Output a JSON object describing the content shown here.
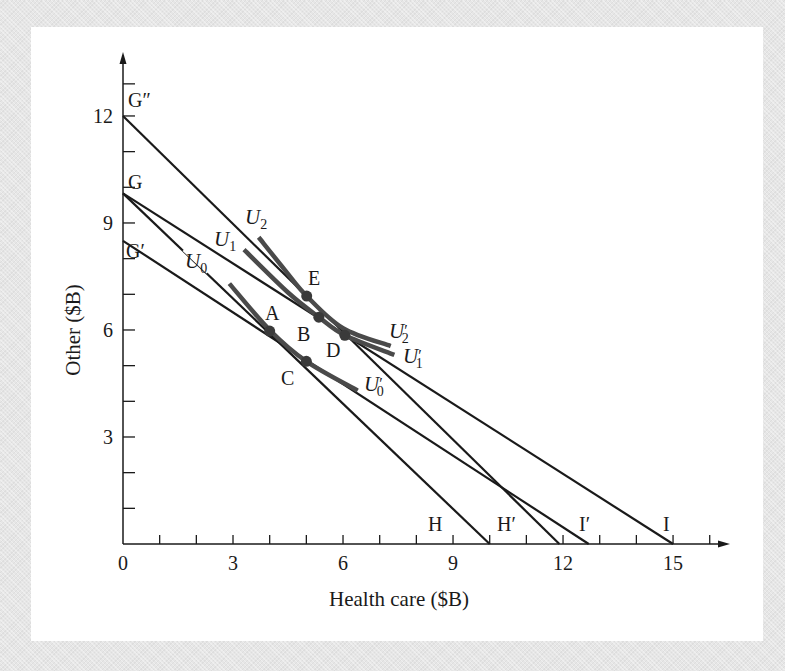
{
  "chart_data": {
    "type": "line",
    "title": "",
    "xlabel": "Health care ($B)",
    "ylabel": "Other ($B)",
    "xlim": [
      0,
      16
    ],
    "ylim": [
      0,
      13
    ],
    "xticks": [
      0,
      3,
      6,
      9,
      12,
      15
    ],
    "yticks": [
      3,
      6,
      9,
      12
    ],
    "origin_label": "0",
    "grid": false,
    "budget_lines": [
      {
        "name": "G-H",
        "start_label": "G",
        "end_label": "H",
        "points": [
          [
            0,
            9.83
          ],
          [
            10.0,
            0
          ]
        ]
      },
      {
        "name": "G'-I'",
        "start_label": "G'",
        "end_label": "I'",
        "points": [
          [
            0,
            8.5
          ],
          [
            12.7,
            0
          ]
        ]
      },
      {
        "name": "G-I",
        "start_label": "G",
        "end_label": "I",
        "points": [
          [
            0,
            9.83
          ],
          [
            15.0,
            0
          ]
        ]
      },
      {
        "name": "G''-H'",
        "start_label": "G''",
        "end_label": "H'",
        "points": [
          [
            0,
            12.0
          ],
          [
            11.9,
            0
          ]
        ]
      }
    ],
    "indifference_curves": [
      {
        "name": "U0",
        "label_start": "U0",
        "label_end": "U'0",
        "points": [
          [
            2.9,
            7.3
          ],
          [
            4.0,
            6.0
          ],
          [
            5.0,
            5.12
          ],
          [
            6.4,
            4.3
          ]
        ]
      },
      {
        "name": "U1",
        "label_start": "U1",
        "label_end": "U'1",
        "points": [
          [
            3.3,
            8.25
          ],
          [
            4.5,
            7.05
          ],
          [
            5.34,
            6.36
          ],
          [
            6.05,
            5.85
          ],
          [
            7.4,
            5.3
          ]
        ]
      },
      {
        "name": "U2",
        "label_start": "U2",
        "label_end": "U'2",
        "points": [
          [
            3.7,
            8.6
          ],
          [
            4.4,
            7.7
          ],
          [
            5.01,
            6.95
          ],
          [
            6.0,
            6.05
          ],
          [
            7.3,
            5.55
          ]
        ]
      }
    ],
    "points": [
      {
        "label": "A",
        "x": 4.0,
        "y": 5.97
      },
      {
        "label": "B",
        "x": 5.34,
        "y": 6.36
      },
      {
        "label": "C",
        "x": 5.0,
        "y": 5.12
      },
      {
        "label": "D",
        "x": 6.05,
        "y": 5.85
      },
      {
        "label": "E",
        "x": 5.01,
        "y": 6.95
      }
    ],
    "axis_point_labels": {
      "y_axis": [
        "G''",
        "G",
        "G'"
      ],
      "x_axis": [
        "H",
        "H'",
        "I'",
        "I"
      ]
    }
  },
  "labels": {
    "xlabel": "Health care ($B)",
    "ylabel": "Other ($B)",
    "origin": "0",
    "xticks": [
      "3",
      "6",
      "9",
      "12",
      "15"
    ],
    "yticks": [
      "3",
      "6",
      "9",
      "12"
    ],
    "G2": "G″",
    "G": "G",
    "G1": "G′",
    "H": "H",
    "H1": "H′",
    "I1": "I′",
    "I": "I",
    "A": "A",
    "B": "B",
    "C": "C",
    "D": "D",
    "E": "E",
    "U": "U",
    "sub0": "0",
    "sub1": "1",
    "sub2": "2",
    "prime": "′"
  },
  "colors": {
    "line": "#1a1a1a",
    "curve": "#4a4a4a",
    "point": "#3a3a3a",
    "panel": "#ffffff",
    "background": "#e6e6e6"
  }
}
